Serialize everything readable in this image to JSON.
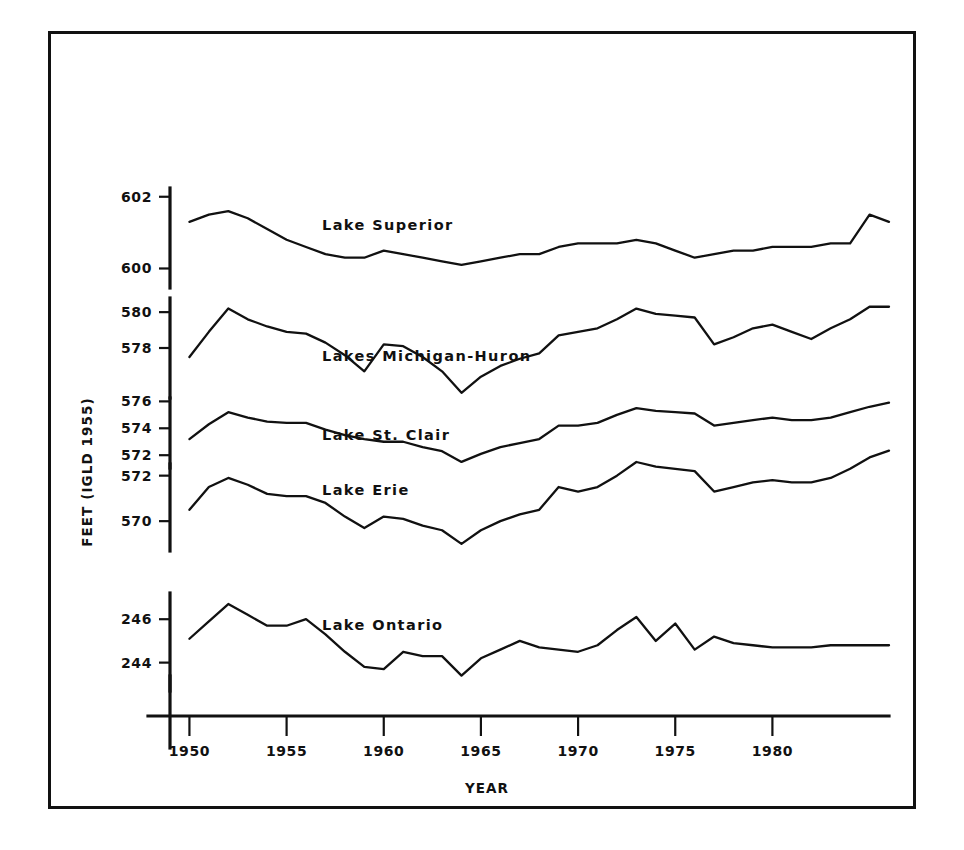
{
  "figure": {
    "xlabel": "YEAR",
    "ylabel": "FEET (IGLD 1955)"
  },
  "chart_data": {
    "type": "line",
    "title": "",
    "xlabel": "YEAR",
    "ylabel": "FEET (IGLD 1955)",
    "grid": false,
    "legend": "inline-labels",
    "xlim": [
      1949,
      1986
    ],
    "x_ticks": [
      1950,
      1955,
      1960,
      1965,
      1970,
      1975,
      1980
    ],
    "x": [
      1950,
      1951,
      1952,
      1953,
      1954,
      1955,
      1956,
      1957,
      1958,
      1959,
      1960,
      1961,
      1962,
      1963,
      1964,
      1965,
      1966,
      1967,
      1968,
      1969,
      1970,
      1971,
      1972,
      1973,
      1974,
      1975,
      1976,
      1977,
      1978,
      1979,
      1980,
      1981,
      1982,
      1983,
      1984,
      1985,
      1986
    ],
    "panels": [
      {
        "name": "Lake Superior",
        "label": "Lake Superior",
        "y_ticks": [
          600,
          602
        ],
        "ylim": [
          599.4,
          602.3
        ],
        "values": [
          601.3,
          601.5,
          601.6,
          601.4,
          601.1,
          600.8,
          600.6,
          600.4,
          600.3,
          600.3,
          600.5,
          600.4,
          600.3,
          600.2,
          600.1,
          600.2,
          600.3,
          600.4,
          600.4,
          600.6,
          600.7,
          600.7,
          600.7,
          600.8,
          600.7,
          600.5,
          600.3,
          600.4,
          600.5,
          600.5,
          600.6,
          600.6,
          600.6,
          600.7,
          600.7,
          601.5,
          601.3
        ]
      },
      {
        "name": "Lakes Michigan-Huron",
        "label": "Lakes Michigan-Huron",
        "y_ticks": [
          578,
          580
        ],
        "ylim": [
          575.1,
          580.9
        ],
        "values": [
          577.5,
          578.9,
          580.2,
          579.6,
          579.2,
          578.9,
          578.8,
          578.3,
          577.6,
          576.7,
          578.2,
          578.1,
          577.5,
          576.7,
          575.5,
          576.4,
          577.0,
          577.4,
          577.7,
          578.7,
          578.9,
          579.1,
          579.6,
          580.2,
          579.9,
          579.8,
          579.7,
          578.2,
          578.6,
          579.1,
          579.3,
          578.9,
          578.5,
          579.1,
          579.6,
          580.3,
          580.3
        ]
      },
      {
        "name": "Lake St. Clair",
        "label": "Lake St. Clair",
        "y_ticks": [
          572,
          574,
          576
        ],
        "ylim": [
          570.9,
          576.4
        ],
        "values": [
          573.2,
          574.3,
          575.2,
          574.8,
          574.5,
          574.4,
          574.4,
          573.9,
          573.5,
          573.2,
          573.0,
          573.0,
          572.6,
          572.3,
          571.5,
          572.1,
          572.6,
          572.9,
          573.2,
          574.2,
          574.2,
          574.4,
          575.0,
          575.5,
          575.3,
          575.2,
          575.1,
          574.2,
          574.4,
          574.6,
          574.8,
          574.6,
          574.6,
          574.8,
          575.2,
          575.6,
          575.9
        ]
      },
      {
        "name": "Lake Erie",
        "label": "Lake Erie",
        "y_ticks": [
          570,
          572
        ],
        "ylim": [
          568.6,
          572.6
        ],
        "values": [
          570.5,
          571.5,
          571.9,
          571.6,
          571.2,
          571.1,
          571.1,
          570.8,
          570.2,
          569.7,
          570.2,
          570.1,
          569.8,
          569.6,
          569.0,
          569.6,
          570.0,
          570.3,
          570.5,
          571.5,
          571.3,
          571.5,
          572.0,
          572.6,
          572.4,
          572.3,
          572.2,
          571.3,
          571.5,
          571.7,
          571.8,
          571.7,
          571.7,
          571.9,
          572.3,
          572.8,
          573.1
        ]
      },
      {
        "name": "Lake Ontario",
        "label": "Lake Ontario",
        "y_ticks": [
          244,
          246
        ],
        "ylim": [
          242.6,
          247.3
        ],
        "values": [
          245.1,
          245.9,
          246.7,
          246.2,
          245.7,
          245.7,
          246.0,
          245.3,
          244.5,
          243.8,
          243.7,
          244.5,
          244.3,
          244.3,
          243.4,
          244.2,
          244.6,
          245.0,
          244.7,
          244.6,
          244.5,
          244.8,
          245.5,
          246.1,
          245.0,
          245.8,
          244.6,
          245.2,
          244.9,
          244.8,
          244.7,
          244.7,
          244.7,
          244.8,
          244.8,
          244.8,
          244.8
        ]
      }
    ]
  }
}
